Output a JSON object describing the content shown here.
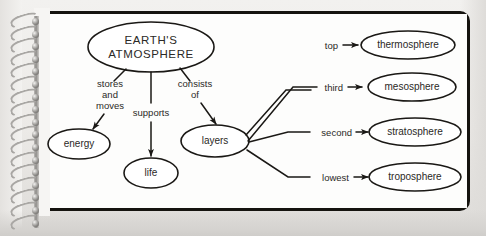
{
  "document": {
    "kind": "spiral-bound notebook page",
    "diagram_type": "concept map",
    "colors": {
      "page": "#fdfdfc",
      "border": "#15130f",
      "ink": "#1a1815",
      "backdrop": "#eceae7",
      "binding_wire": "#a9a7a4"
    },
    "binding": {
      "coil_count": 17
    }
  },
  "diagram": {
    "root": {
      "id": "earths-atmosphere",
      "line1": "EARTH'S",
      "line2": "ATMOSPHERE"
    },
    "branches": [
      {
        "id": "energy",
        "edge_label_lines": [
          "stores",
          "and",
          "moves"
        ],
        "target": "energy"
      },
      {
        "id": "life",
        "edge_label_lines": [
          "supports"
        ],
        "target": "life"
      },
      {
        "id": "layers",
        "edge_label_lines": [
          "consists",
          "of"
        ],
        "target": "layers"
      }
    ],
    "layers_hub": "layers",
    "layers": [
      {
        "rank_label": "top",
        "name": "thermosphere"
      },
      {
        "rank_label": "third",
        "name": "mesosphere"
      },
      {
        "rank_label": "second",
        "name": "stratosphere"
      },
      {
        "rank_label": "lowest",
        "name": "troposphere"
      }
    ]
  }
}
